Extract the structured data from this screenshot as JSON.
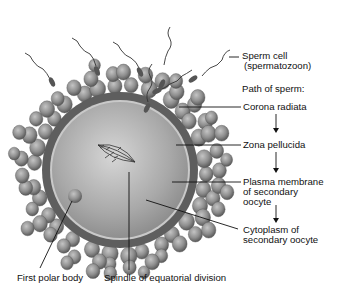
{
  "diagram": {
    "labels": {
      "sperm_cell_line1": "Sperm cell",
      "sperm_cell_line2": "(spermatozoon)",
      "path_heading": "Path of sperm:",
      "corona_radiata": "Corona radiata",
      "zona_pellucida": "Zona pellucida",
      "plasma_membrane_line1": "Plasma membrane",
      "plasma_membrane_line2": "of secondary",
      "plasma_membrane_line3": "oocyte",
      "cytoplasm_line1": "Cytoplasm of",
      "cytoplasm_line2": "secondary oocyte",
      "first_polar_body": "First polar body",
      "spindle": "Spindle of equatorial division"
    },
    "path_of_sperm": [
      "Corona radiata",
      "Zona pellucida",
      "Plasma membrane of secondary oocyte",
      "Cytoplasm of secondary oocyte"
    ],
    "colors": {
      "cytoplasm": "#a9a9a9",
      "zona": "#5e5e5e",
      "corona_cell": "#8c8c8c",
      "line": "#111111"
    }
  }
}
